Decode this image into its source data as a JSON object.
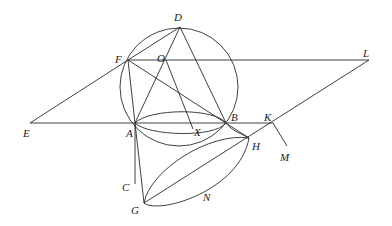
{
  "figure": {
    "type": "geometric-construction",
    "stroke_color": "#2a2a2a",
    "background": "#ffffff"
  },
  "points": {
    "D": {
      "label": "D",
      "x": 180,
      "y": 27
    },
    "F": {
      "label": "F",
      "x": 128,
      "y": 60
    },
    "O": {
      "label": "O",
      "x": 166,
      "y": 60
    },
    "L": {
      "label": "L",
      "x": 369,
      "y": 60
    },
    "E": {
      "label": "E",
      "x": 30,
      "y": 123
    },
    "A": {
      "label": "A",
      "x": 135,
      "y": 123
    },
    "X": {
      "label": "X",
      "x": 193,
      "y": 129
    },
    "B": {
      "label": "B",
      "x": 226,
      "y": 123
    },
    "K": {
      "label": "K",
      "x": 273,
      "y": 123
    },
    "M": {
      "label": "M",
      "x": 287,
      "y": 146
    },
    "H": {
      "label": "H",
      "x": 249,
      "y": 138
    },
    "C": {
      "label": "C",
      "x": 135,
      "y": 184
    },
    "G": {
      "label": "G",
      "x": 144,
      "y": 203
    },
    "N": {
      "label": "N"
    }
  },
  "labels": [
    {
      "text": "D",
      "x": 174,
      "y": 21
    },
    {
      "text": "F",
      "x": 115,
      "y": 63
    },
    {
      "text": "O",
      "x": 157,
      "y": 62
    },
    {
      "text": "L",
      "x": 363,
      "y": 57
    },
    {
      "text": "E",
      "x": 23,
      "y": 137
    },
    {
      "text": "A",
      "x": 126,
      "y": 137
    },
    {
      "text": "X",
      "x": 194,
      "y": 136
    },
    {
      "text": "B",
      "x": 231,
      "y": 121
    },
    {
      "text": "K",
      "x": 264,
      "y": 121
    },
    {
      "text": "H",
      "x": 252,
      "y": 150
    },
    {
      "text": "M",
      "x": 280,
      "y": 161
    },
    {
      "text": "C",
      "x": 122,
      "y": 191
    },
    {
      "text": "G",
      "x": 131,
      "y": 214
    },
    {
      "text": "N",
      "x": 203,
      "y": 201
    }
  ],
  "circle": {
    "cx": 179,
    "cy": 87,
    "r": 59
  }
}
